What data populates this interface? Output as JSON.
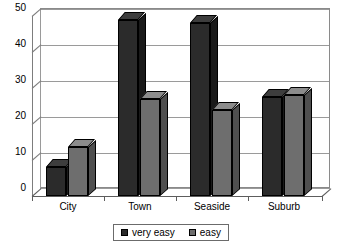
{
  "chart_data": {
    "type": "bar",
    "title": "",
    "subtitle": "",
    "xlabel": "",
    "ylabel": "",
    "categories": [
      "City",
      "Town",
      "Seaside",
      "Suburb"
    ],
    "series": [
      {
        "name": "very easy",
        "color": "#2b2b2b",
        "values": [
          8,
          49,
          48,
          27.5
        ]
      },
      {
        "name": "easy",
        "color": "#6e6e6e",
        "values": [
          13.5,
          27,
          24,
          28
        ]
      }
    ],
    "ylim": [
      0,
      50
    ],
    "yticks": [
      0,
      10,
      20,
      30,
      40,
      50
    ],
    "ytick_labels": [
      "0",
      "10",
      "20",
      "30",
      "40",
      "50"
    ],
    "grid": true,
    "grid_axis": "y",
    "legend_position": "bottom-center",
    "style_3d": true,
    "plot_background": "#ffffff",
    "grid_color": "#9a9a9a",
    "axis_color": "#5d5d5d"
  },
  "legend": {
    "items": [
      {
        "label": "very easy",
        "swatch_icon": "legend-swatch-dark"
      },
      {
        "label": "easy",
        "swatch_icon": "legend-swatch-gray"
      }
    ]
  },
  "axes": {
    "y": {
      "labels": [
        "50",
        "40",
        "30",
        "20",
        "10",
        "0"
      ]
    },
    "x": {
      "labels": [
        "City",
        "Town",
        "Seaside",
        "Suburb"
      ]
    }
  }
}
